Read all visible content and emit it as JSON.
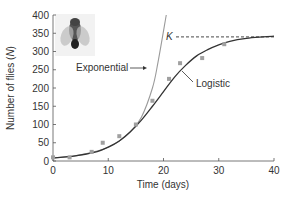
{
  "chart_data": {
    "type": "line",
    "title": "",
    "xlabel": "Time (days)",
    "ylabel": "Number of flies (N)",
    "xlim": [
      0,
      40
    ],
    "ylim": [
      0,
      400
    ],
    "xticks": [
      0,
      10,
      20,
      30,
      40
    ],
    "yticks": [
      0,
      50,
      100,
      150,
      200,
      250,
      300,
      350,
      400
    ],
    "grid": false,
    "carrying_capacity": {
      "label": "K",
      "value": 340
    },
    "series": [
      {
        "name": "Exponential",
        "style": "line",
        "color": "#9a9a9a",
        "x": [
          0,
          4,
          8,
          10,
          12,
          14,
          16,
          18,
          19,
          20.5
        ],
        "y": [
          8,
          14,
          27,
          38,
          55,
          80,
          120,
          200,
          270,
          400
        ]
      },
      {
        "name": "Logistic",
        "style": "line",
        "color": "#333333",
        "x": [
          0,
          4,
          8,
          10,
          12,
          14,
          16,
          18,
          20,
          22,
          24,
          26,
          28,
          30,
          32,
          35,
          38,
          40
        ],
        "y": [
          8,
          14,
          26,
          38,
          55,
          80,
          112,
          150,
          190,
          230,
          262,
          288,
          305,
          318,
          328,
          336,
          340,
          342
        ]
      },
      {
        "name": "Observed",
        "style": "scatter",
        "color": "#a0a0a0",
        "x": [
          0,
          3,
          7,
          9,
          12,
          15,
          18,
          21,
          23,
          27,
          31
        ],
        "y": [
          10,
          10,
          25,
          50,
          68,
          100,
          165,
          225,
          268,
          282,
          320
        ]
      }
    ],
    "annotations": [
      {
        "text": "Exponential",
        "arrow_to": "exponential curve"
      },
      {
        "text": "Logistic",
        "arrow_to": "logistic curve"
      },
      {
        "text": "K",
        "note": "dashed line at carrying capacity"
      }
    ]
  }
}
